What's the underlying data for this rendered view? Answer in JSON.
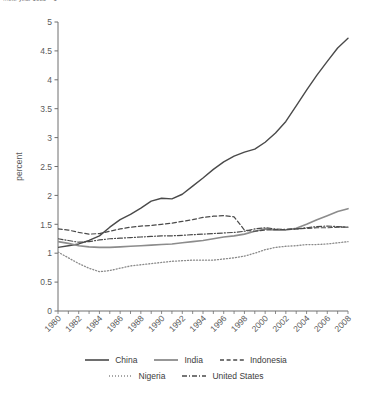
{
  "caption": "...the year 1980 = 1",
  "chart_data": {
    "type": "line",
    "title": "",
    "xlabel": "",
    "ylabel": "percent",
    "xlim": [
      1980,
      2008
    ],
    "ylim": [
      0,
      5
    ],
    "ytick_step": 0.5,
    "xtick_step": 2,
    "grid": false,
    "legend_position": "bottom",
    "ytick_labels": [
      "0",
      "0.5",
      "1",
      "1.5",
      "2",
      "2.5",
      "3",
      "3.5",
      "4",
      "4.5",
      "5"
    ],
    "xtick_labels": [
      "1980",
      "1982",
      "1984",
      "1986",
      "1988",
      "1990",
      "1992",
      "1994",
      "1996",
      "1998",
      "2000",
      "2002",
      "2004",
      "2006",
      "2008"
    ],
    "x": [
      1980,
      1981,
      1982,
      1983,
      1984,
      1985,
      1986,
      1987,
      1988,
      1989,
      1990,
      1991,
      1992,
      1993,
      1994,
      1995,
      1996,
      1997,
      1998,
      1999,
      2000,
      2001,
      2002,
      2003,
      2004,
      2005,
      2006,
      2007,
      2008
    ],
    "series": [
      {
        "name": "China",
        "style": "solid",
        "color": "#4a4a4a",
        "width": 1.4,
        "values": [
          1.1,
          1.13,
          1.16,
          1.22,
          1.3,
          1.45,
          1.58,
          1.67,
          1.78,
          1.9,
          1.95,
          1.94,
          2.02,
          2.16,
          2.3,
          2.45,
          2.58,
          2.68,
          2.75,
          2.8,
          2.92,
          3.08,
          3.28,
          3.55,
          3.82,
          4.08,
          4.32,
          4.55,
          4.72
        ]
      },
      {
        "name": "India",
        "style": "solid",
        "color": "#8c8c8c",
        "width": 1.6,
        "values": [
          1.2,
          1.17,
          1.13,
          1.11,
          1.1,
          1.1,
          1.11,
          1.12,
          1.13,
          1.14,
          1.15,
          1.16,
          1.18,
          1.2,
          1.22,
          1.25,
          1.28,
          1.3,
          1.33,
          1.38,
          1.42,
          1.4,
          1.4,
          1.43,
          1.5,
          1.58,
          1.65,
          1.72,
          1.77
        ]
      },
      {
        "name": "Indonesia",
        "style": "dashed",
        "color": "#4a4a4a",
        "width": 1.2,
        "values": [
          1.42,
          1.4,
          1.36,
          1.33,
          1.34,
          1.38,
          1.42,
          1.45,
          1.47,
          1.48,
          1.5,
          1.52,
          1.55,
          1.58,
          1.62,
          1.64,
          1.65,
          1.63,
          1.4,
          1.38,
          1.4,
          1.41,
          1.41,
          1.42,
          1.43,
          1.44,
          1.44,
          1.45,
          1.45
        ]
      },
      {
        "name": "Nigeria",
        "style": "dotted",
        "color": "#8a8a8a",
        "width": 1.3,
        "values": [
          1.02,
          0.92,
          0.82,
          0.74,
          0.68,
          0.7,
          0.74,
          0.78,
          0.8,
          0.82,
          0.84,
          0.86,
          0.87,
          0.88,
          0.88,
          0.88,
          0.9,
          0.92,
          0.95,
          1.0,
          1.06,
          1.1,
          1.12,
          1.13,
          1.15,
          1.15,
          1.16,
          1.18,
          1.2
        ]
      },
      {
        "name": "United States",
        "style": "dashdot",
        "color": "#4a4a4a",
        "width": 1.2,
        "values": [
          1.25,
          1.22,
          1.19,
          1.2,
          1.23,
          1.25,
          1.26,
          1.27,
          1.28,
          1.29,
          1.3,
          1.3,
          1.31,
          1.32,
          1.33,
          1.34,
          1.35,
          1.36,
          1.38,
          1.42,
          1.44,
          1.42,
          1.41,
          1.42,
          1.44,
          1.46,
          1.47,
          1.46,
          1.45
        ]
      }
    ]
  },
  "legend": {
    "row1": [
      {
        "label": "China",
        "style": "solid",
        "color": "#4a4a4a"
      },
      {
        "label": "India",
        "style": "solid",
        "color": "#8c8c8c"
      },
      {
        "label": "Indonesia",
        "style": "dashed",
        "color": "#4a4a4a"
      }
    ],
    "row2": [
      {
        "label": "Nigeria",
        "style": "dotted",
        "color": "#8a8a8a"
      },
      {
        "label": "United States",
        "style": "dashdot",
        "color": "#4a4a4a"
      }
    ]
  }
}
